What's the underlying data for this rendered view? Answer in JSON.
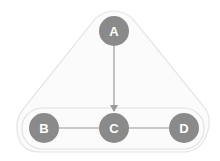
{
  "diagram": {
    "type": "graph",
    "colors": {
      "node_fill": "#8a8a8a",
      "node_text": "#ffffff",
      "edge": "#9a9a9a",
      "hull_stroke": "#e6e6e6",
      "hull_fill": "#fafafa",
      "group_stroke": "#e2e2e2"
    },
    "nodes": [
      {
        "id": "A",
        "label": "A"
      },
      {
        "id": "B",
        "label": "B"
      },
      {
        "id": "C",
        "label": "C"
      },
      {
        "id": "D",
        "label": "D"
      }
    ],
    "edges": [
      {
        "from": "A",
        "to": "C",
        "directed": true
      },
      {
        "from": "B",
        "to": "C",
        "directed": false
      },
      {
        "from": "C",
        "to": "D",
        "directed": false
      }
    ],
    "groups": [
      {
        "name": "outer-hull",
        "members": [
          "A",
          "B",
          "C",
          "D"
        ]
      },
      {
        "name": "bottom-row",
        "members": [
          "B",
          "C",
          "D"
        ]
      }
    ]
  }
}
